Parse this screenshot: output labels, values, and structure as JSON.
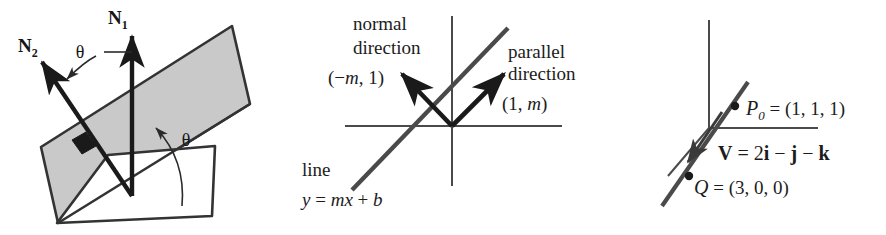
{
  "figure": {
    "caption": "",
    "panels": [
      {
        "id": "planes",
        "name": "two-planes-dihedral-angle",
        "labels": {
          "normal_1": "N",
          "normal_1_sub": "1",
          "normal_2": "N",
          "normal_2_sub": "2",
          "theta_normals": "θ",
          "theta_planes": "θ"
        },
        "shading": {
          "tilted_plane_fill": "#c9c9c9",
          "horizontal_plane_fill": "#ffffff",
          "right_angle_marker_fill": "#1a1a1a",
          "stroke": "#333333"
        }
      },
      {
        "id": "line2d",
        "name": "line-normal-and-parallel-directions",
        "labels": {
          "normal_word_1": "normal",
          "normal_word_2": "direction",
          "normal_vector": "(−m, 1)",
          "normal_vector_parts": {
            "open": "(−",
            "m": "m",
            "close": ", 1)"
          },
          "parallel_word_1": "parallel",
          "parallel_word_2": "direction",
          "parallel_vector": "(1, m)",
          "parallel_vector_parts": {
            "open": "(1, ",
            "m": "m",
            "close": ")"
          },
          "line_word": "line",
          "line_equation": "y = mx + b",
          "line_equation_parts": {
            "y": "y",
            "eq": " = ",
            "mx": "mx",
            "plus": " + ",
            "b": "b"
          }
        },
        "colors": {
          "axis": "#4a4a4a",
          "line": "#4a4a4a",
          "arrow": "#1a1a1a"
        }
      },
      {
        "id": "line3d",
        "name": "line-through-point-with-direction-vector",
        "labels": {
          "point_name": "P",
          "point_sub": "0",
          "point_value": " = (1, 1, 1)",
          "vector_name": "V",
          "vector_value": " = 2i − j − k",
          "vector_parts": {
            "V": "V",
            "eq": " = ",
            "two": "2",
            "i": "i",
            "minus1": " − ",
            "j": "j",
            "minus2": " − ",
            "k": "k"
          },
          "q_name": "Q",
          "q_value": " = (3, 0, 0)"
        },
        "colors": {
          "axis": "#4a4a4a",
          "line": "#4a4a4a",
          "dot": "#1a1a1a"
        }
      }
    ]
  }
}
